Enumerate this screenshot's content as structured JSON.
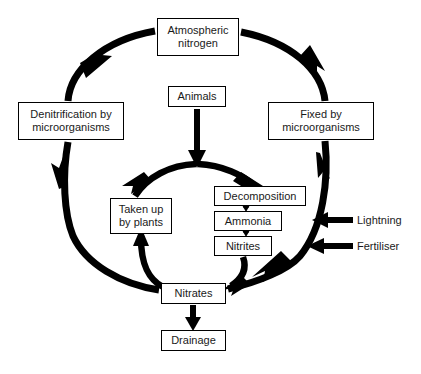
{
  "diagram": {
    "background_color": "#ffffff",
    "stroke_color": "#000000",
    "text_color": "#1a1a1a",
    "nodes": {
      "atmospheric_nitrogen": {
        "line1": "Atmospheric",
        "line2": "nitrogen"
      },
      "denitrification": {
        "line1": "Denitrification by",
        "line2": "microorganisms"
      },
      "fixed_by": {
        "line1": "Fixed by",
        "line2": "microorganisms"
      },
      "animals": {
        "line1": "Animals"
      },
      "taken_up": {
        "line1": "Taken up",
        "line2": "by plants"
      },
      "decomposition": {
        "line1": "Decomposition"
      },
      "ammonia": {
        "line1": "Ammonia"
      },
      "nitrites": {
        "line1": "Nitrites"
      },
      "nitrates": {
        "line1": "Nitrates"
      },
      "drainage": {
        "line1": "Drainage"
      }
    },
    "external_inputs": {
      "lightning": "Lightning",
      "fertiliser": "Fertiliser"
    },
    "flows": [
      {
        "from": "atmospheric_nitrogen",
        "to": "fixed_by",
        "style": "thick-curved-arc",
        "side": "right"
      },
      {
        "from": "fixed_by",
        "to": "nitrates",
        "style": "thick-curved-arc",
        "side": "right"
      },
      {
        "from": "nitrates",
        "to": "denitrification",
        "style": "thick-curved-arc",
        "side": "left"
      },
      {
        "from": "denitrification",
        "to": "atmospheric_nitrogen",
        "style": "thick-curved-arc",
        "side": "left"
      },
      {
        "from": "animals",
        "to": "inner_cycle",
        "style": "thick-straight-arrow"
      },
      {
        "from": "inner_cycle_top",
        "to": "taken_up",
        "style": "thick-curved-arc",
        "side": "inner-left"
      },
      {
        "from": "inner_cycle_top",
        "to": "decomposition",
        "style": "thick-curved-arc",
        "side": "inner-right"
      },
      {
        "from": "nitrites",
        "to": "nitrates",
        "style": "thick-curved-arc",
        "side": "inner-right"
      },
      {
        "from": "nitrates",
        "to": "taken_up",
        "style": "thick-curved-arc",
        "side": "inner-left"
      },
      {
        "from": "decomposition",
        "to": "ammonia",
        "style": "short-connector-arrow"
      },
      {
        "from": "ammonia",
        "to": "nitrites",
        "style": "short-connector-arrow"
      },
      {
        "from": "nitrates",
        "to": "drainage",
        "style": "thick-straight-arrow"
      },
      {
        "from": "lightning",
        "to": "fixed_by_arc",
        "style": "thick-straight-arrow-left"
      },
      {
        "from": "fertiliser",
        "to": "fixed_by_arc",
        "style": "thick-straight-arrow-left"
      }
    ]
  }
}
